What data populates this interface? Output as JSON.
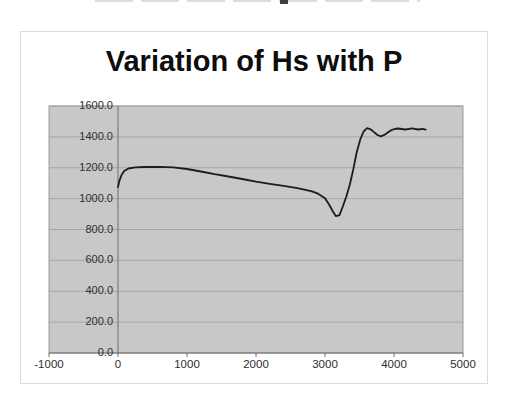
{
  "page": {
    "background": "#ffffff"
  },
  "top_remnant": {
    "dash_color": "#dedede",
    "blob_color": "#3f3f3f"
  },
  "chart_data": {
    "type": "line",
    "title": "Variation of Hs with P",
    "xlabel": "",
    "ylabel": "",
    "legend": "none",
    "grid": "horizontal",
    "xlim": [
      -1000,
      5000
    ],
    "ylim": [
      0,
      1600
    ],
    "x_ticks": [
      {
        "v": -1000,
        "label": "-1000"
      },
      {
        "v": 0,
        "label": "0"
      },
      {
        "v": 1000,
        "label": "1000"
      },
      {
        "v": 2000,
        "label": "2000"
      },
      {
        "v": 3000,
        "label": "3000"
      },
      {
        "v": 4000,
        "label": "4000"
      },
      {
        "v": 5000,
        "label": "5000"
      }
    ],
    "y_ticks": [
      {
        "v": 1600,
        "label": "1600.0"
      },
      {
        "v": 1400,
        "label": "1400.0"
      },
      {
        "v": 1200,
        "label": "1200.0"
      },
      {
        "v": 1000,
        "label": "1000.0"
      },
      {
        "v": 800,
        "label": "800.0"
      },
      {
        "v": 600,
        "label": "600.0"
      },
      {
        "v": 400,
        "label": "400.0"
      },
      {
        "v": 200,
        "label": "200.0"
      },
      {
        "v": 0,
        "label": "0.0"
      }
    ],
    "colors": {
      "plot_bg": "#c8c8c8",
      "gridline": "#a6a6a6",
      "axis": "#6e6e6e",
      "plot_border": "#9b9b9b",
      "series_line": "#1c1c1c",
      "title": "#0d0d0d",
      "tick_text": "#2e2e2e"
    },
    "series": [
      {
        "name": "Hs",
        "points": [
          [
            0,
            1075
          ],
          [
            20,
            1115
          ],
          [
            50,
            1152
          ],
          [
            90,
            1178
          ],
          [
            150,
            1195
          ],
          [
            250,
            1202
          ],
          [
            400,
            1205
          ],
          [
            600,
            1206
          ],
          [
            800,
            1202
          ],
          [
            1000,
            1192
          ],
          [
            1200,
            1176
          ],
          [
            1400,
            1158
          ],
          [
            1600,
            1143
          ],
          [
            1800,
            1127
          ],
          [
            2000,
            1110
          ],
          [
            2200,
            1096
          ],
          [
            2400,
            1083
          ],
          [
            2600,
            1068
          ],
          [
            2800,
            1048
          ],
          [
            2900,
            1032
          ],
          [
            3000,
            1002
          ],
          [
            3060,
            962
          ],
          [
            3110,
            920
          ],
          [
            3160,
            886
          ],
          [
            3210,
            893
          ],
          [
            3260,
            950
          ],
          [
            3310,
            1015
          ],
          [
            3360,
            1090
          ],
          [
            3410,
            1190
          ],
          [
            3460,
            1300
          ],
          [
            3510,
            1382
          ],
          [
            3560,
            1435
          ],
          [
            3610,
            1456
          ],
          [
            3660,
            1449
          ],
          [
            3710,
            1431
          ],
          [
            3760,
            1412
          ],
          [
            3810,
            1404
          ],
          [
            3860,
            1413
          ],
          [
            3910,
            1429
          ],
          [
            3960,
            1443
          ],
          [
            4010,
            1451
          ],
          [
            4060,
            1454
          ],
          [
            4110,
            1451
          ],
          [
            4160,
            1448
          ],
          [
            4210,
            1451
          ],
          [
            4260,
            1455
          ],
          [
            4310,
            1451
          ],
          [
            4360,
            1448
          ],
          [
            4410,
            1452
          ],
          [
            4460,
            1447
          ]
        ]
      }
    ]
  }
}
